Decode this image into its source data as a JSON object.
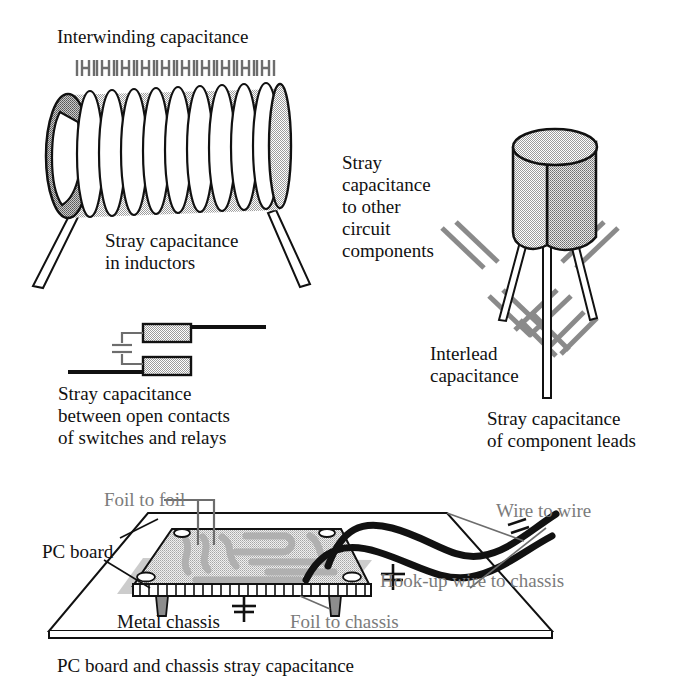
{
  "figure": {
    "caption": "PC board and chassis stray capacitance",
    "background_color": "#ffffff",
    "ink_color": "#111111",
    "gray_label_color": "#7b7b7b"
  },
  "labels": {
    "interwinding_capacitance": "Interwinding capacitance",
    "stray_capacitance_in_inductors": "Stray capacitance\nin inductors",
    "stray_capacitance_to_other_circuit_components": "Stray\ncapacitance\nto other\ncircuit\ncomponents",
    "stray_capacitance_between_open_contacts": "Stray capacitance\nbetween open contacts\nof switches and relays",
    "interlead_capacitance": "Interlead\ncapacitance",
    "stray_capacitance_of_component_leads": "Stray capacitance\nof component leads",
    "foil_to_foil": "Foil to foil",
    "pc_board": "PC board",
    "wire_to_wire": "Wire to wire",
    "hookup_wire_to_chassis": "Hook-up wire to chassis",
    "metal_chassis": "Metal chassis",
    "foil_to_chassis": "Foil to chassis",
    "bottom_caption": "PC board and chassis stray capacitance"
  },
  "label_lines": {
    "stray_inductors": [
      "Stray capacitance",
      "in inductors"
    ],
    "stray_other_components": [
      "Stray",
      "capacitance",
      "to other",
      "circuit",
      "components"
    ],
    "stray_switch_contacts": [
      "Stray capacitance",
      "between open contacts",
      "of switches and relays"
    ],
    "interlead": [
      "Interlead",
      "capacitance"
    ],
    "component_leads": [
      "Stray capacitance",
      "of component leads"
    ]
  },
  "components": {
    "inductor": {
      "name": "air-core coil inductor",
      "turns": 10,
      "coil_fill": "#bdbdbd",
      "coil_end_fill": "#9a9a9a",
      "lead_count": 2,
      "capacitor_symbols_on_top": 11
    },
    "transistor": {
      "name": "metal can transistor",
      "body_front_fill": "#d2d2d2",
      "body_side_fill": "#a9a9a9",
      "lead_count": 3,
      "capacitor_symbols": 6
    },
    "switch_contacts": {
      "name": "open switch contacts",
      "pad_fill": "#b5b5b5",
      "pad_count": 2,
      "capacitor_symbols": 1
    },
    "pc_board": {
      "name": "printed circuit board on metal chassis",
      "board_fill": "#d9d9d9",
      "trace_fill": "#bdbdbd",
      "chassis_fill": "#ffffff",
      "mounting_holes": 4,
      "standoffs": 2,
      "hookup_wires": 2,
      "capacitor_symbols": 3
    }
  }
}
